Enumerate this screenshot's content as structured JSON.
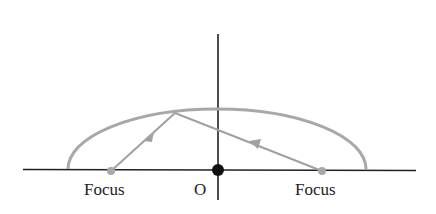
{
  "diagram": {
    "type": "ellipse-reflection",
    "labels": {
      "left_focus": "Focus",
      "origin": "O",
      "right_focus": "Focus"
    },
    "colors": {
      "axes": "#222222",
      "ellipse": "#a8a8a8",
      "rays": "#a0a0a0",
      "focus_points": "#a8a8a8",
      "origin_point": "#111111"
    },
    "geometry": {
      "ellipse_center": [
        217,
        169
      ],
      "ellipse_rx": 149,
      "ellipse_ry": 60,
      "left_focus": [
        111,
        170
      ],
      "right_focus": [
        322,
        170
      ],
      "origin": [
        218,
        170
      ],
      "reflection_point": [
        175,
        113
      ]
    }
  }
}
